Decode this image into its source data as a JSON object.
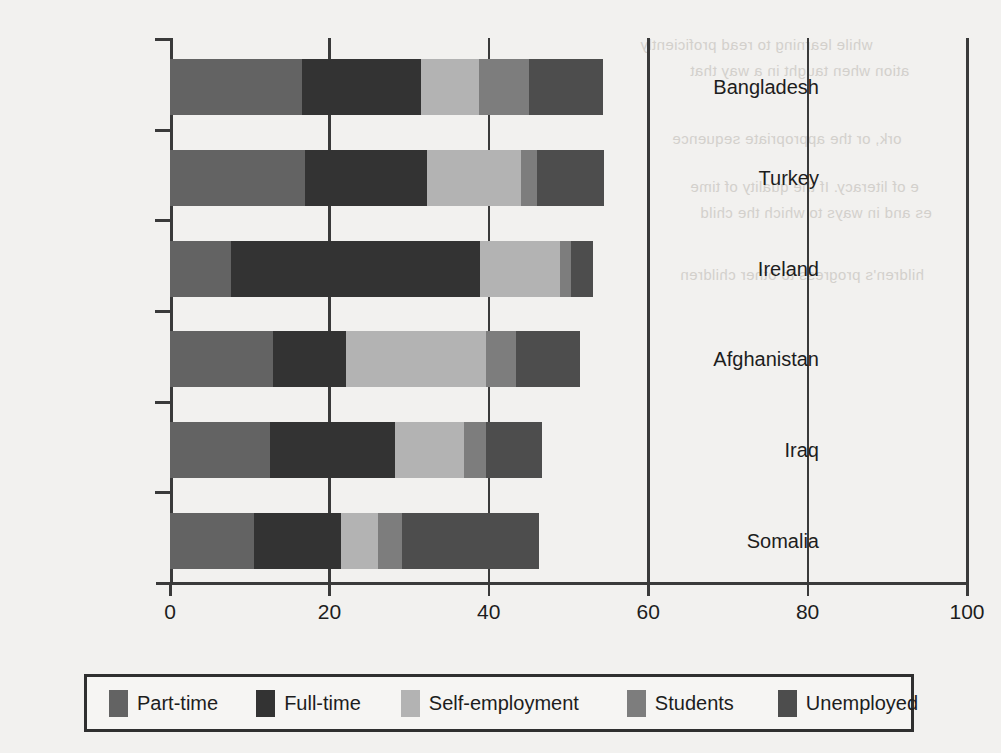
{
  "chart_data": {
    "type": "bar",
    "orientation": "horizontal",
    "stacked": true,
    "title": "",
    "xlabel": "",
    "ylabel": "",
    "xlim": [
      0,
      100
    ],
    "xticks": [
      0,
      20,
      40,
      60,
      80,
      100
    ],
    "xtick_labels": [
      "0",
      "20",
      "40",
      "60",
      "80",
      "100"
    ],
    "grid": true,
    "legend_position": "bottom",
    "categories": [
      "Bangladesh",
      "Turkey",
      "Ireland",
      "Afghanistan",
      "Iraq",
      "Somalia"
    ],
    "series": [
      {
        "name": "Part-time",
        "color": "#636363",
        "values": [
          16.5,
          17.0,
          7.6,
          12.9,
          12.6,
          10.6
        ]
      },
      {
        "name": "Full-time",
        "color": "#333333",
        "values": [
          15.0,
          15.2,
          31.3,
          9.2,
          15.6,
          10.8
        ]
      },
      {
        "name": "Self-employment",
        "color": "#b3b3b3",
        "values": [
          7.3,
          11.9,
          10.0,
          17.5,
          8.7,
          4.7
        ]
      },
      {
        "name": "Students",
        "color": "#7d7d7d",
        "values": [
          6.2,
          2.0,
          1.4,
          3.8,
          2.7,
          3.0
        ]
      },
      {
        "name": "Unemployed",
        "color": "#4d4d4d",
        "values": [
          9.3,
          8.4,
          2.8,
          8.1,
          7.1,
          17.2
        ]
      }
    ],
    "totals": [
      54.3,
      54.5,
      53.1,
      51.5,
      46.7,
      46.3
    ]
  },
  "legend": {
    "items": [
      {
        "label": "Part-time",
        "color": "#636363"
      },
      {
        "label": "Full-time",
        "color": "#333333"
      },
      {
        "label": "Self-employment",
        "color": "#b3b3b3"
      },
      {
        "label": "Students",
        "color": "#7d7d7d"
      },
      {
        "label": "Unemployed",
        "color": "#4d4d4d"
      }
    ]
  },
  "ghost_text": {
    "lines": [
      "while learning to read proficiently",
      "ation when taught in a way that",
      "ork, or the appropriate sequence",
      "e of literacy. If the quality of time",
      "es and in ways to which the child",
      "hildren's progress to other children"
    ]
  }
}
